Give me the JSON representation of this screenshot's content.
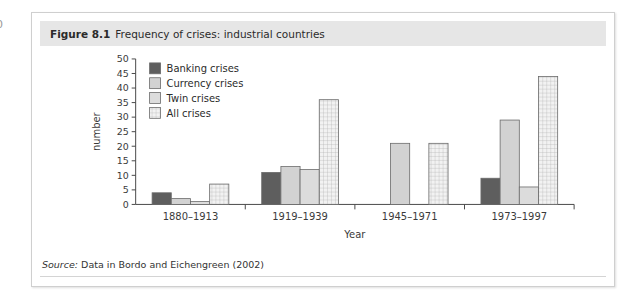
{
  "page_number": "0",
  "figure": {
    "number": "Figure 8.1",
    "title": "Frequency of crises: industrial countries",
    "source_label": "Source:",
    "source_text": " Data in Bordo and Eichengreen (2002)"
  },
  "colors": {
    "banking": "#5e5e5e",
    "currency": "#d2d2d2",
    "twin": "#dcdcdc",
    "all": "#f2f2f2",
    "grid_stroke": "#b0b0b0",
    "axis": "#4a4a4a",
    "header_band": "#e6e6e6",
    "box_border": "#cfcfcf"
  },
  "chart_data": {
    "type": "bar",
    "title": "Frequency of crises: industrial countries",
    "xlabel": "Year",
    "ylabel": "number",
    "ylim": [
      0,
      50
    ],
    "ytick_step": 5,
    "yticks": [
      0,
      5,
      10,
      15,
      20,
      25,
      30,
      35,
      40,
      45,
      50
    ],
    "grid": false,
    "legend_position": "top-left inside plot",
    "categories": [
      "1880–1913",
      "1919–1939",
      "1945–1971",
      "1973–1997"
    ],
    "series": [
      {
        "name": "Banking crises",
        "values": [
          4,
          11,
          0,
          9
        ],
        "fill": "#5e5e5e",
        "pattern": "solid"
      },
      {
        "name": "Currency crises",
        "values": [
          2,
          13,
          21,
          29
        ],
        "fill": "#d2d2d2",
        "pattern": "solid"
      },
      {
        "name": "Twin crises",
        "values": [
          1,
          12,
          0,
          6
        ],
        "fill": "#dcdcdc",
        "pattern": "solid"
      },
      {
        "name": "All crises",
        "values": [
          7,
          36,
          21,
          44
        ],
        "fill": "#f2f2f2",
        "pattern": "grid"
      }
    ]
  }
}
